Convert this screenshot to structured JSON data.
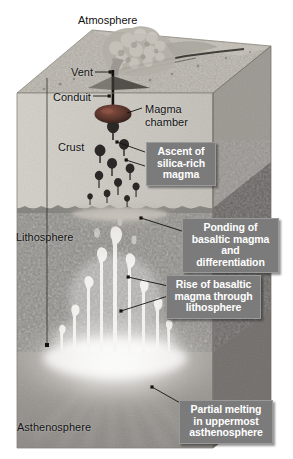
{
  "figure": {
    "kind": "geological-block-diagram",
    "width": 293,
    "height": 459,
    "background_color": "#ffffff"
  },
  "colors": {
    "callout_fill": "#7b7b7b",
    "callout_border": "#9a9a9a",
    "callout_text": "#ffffff",
    "map_label_text": "#111111",
    "crust_top_surface": "#b9b4ab",
    "crust_front_face": "#cdcac3",
    "crust_side_face": "#9d9a94",
    "lithosphere_front": "#8f8d88",
    "lithosphere_side": "#6e6c69",
    "asthenosphere_front": "#9b9894",
    "melt_glow": "#ffffff",
    "magma_chamber": "#5e3a33",
    "diapir": "#2e2b29",
    "plume": "#f2f0ec",
    "leader_line": "#14120f",
    "plume_cloud": "#b2aea6"
  },
  "map_labels": [
    {
      "name": "atmosphere",
      "text": "Atmosphere",
      "x": 78,
      "y": 14
    },
    {
      "name": "vent",
      "text": "Vent",
      "x": 71,
      "y": 66
    },
    {
      "name": "conduit",
      "text": "Conduit",
      "x": 53,
      "y": 91
    },
    {
      "name": "magma-chamber",
      "text": "Magma\nchamber",
      "x": 145,
      "y": 103
    },
    {
      "name": "crust",
      "text": "Crust",
      "x": 58,
      "y": 141
    },
    {
      "name": "lithosphere",
      "text": "Lithosphere",
      "x": 16,
      "y": 231
    },
    {
      "name": "asthenosphere",
      "text": "Asthenosphere",
      "x": 17,
      "y": 421
    }
  ],
  "callouts": [
    {
      "name": "ascent-of-silica-rich-magma",
      "text": "Ascent of\nsilica-rich\nmagma",
      "x": 146,
      "y": 142,
      "width": 70,
      "height": 44
    },
    {
      "name": "ponding-of-basaltic-magma",
      "text": "Ponding of\nbasaltic magma\nand differentiation",
      "x": 182,
      "y": 218,
      "width": 97,
      "height": 44
    },
    {
      "name": "rise-of-basaltic-magma",
      "text": "Rise of basaltic\nmagma through\nlithosphere",
      "x": 166,
      "y": 275,
      "width": 95,
      "height": 44
    },
    {
      "name": "partial-melting-asthenosphere",
      "text": "Partial melting\nin uppermost\nasthenosphere",
      "x": 179,
      "y": 400,
      "width": 94,
      "height": 44
    }
  ],
  "layers": [
    {
      "name": "crust",
      "top_y": 93,
      "bottom_y": 208
    },
    {
      "name": "lithosphere",
      "top_y": 208,
      "bottom_y": 352
    },
    {
      "name": "asthenosphere",
      "top_y": 352,
      "bottom_y": 448
    }
  ],
  "features": {
    "volcano_vent_x": 113,
    "volcano_vent_y": 72,
    "magma_chamber": {
      "cx": 113,
      "cy": 114,
      "rx": 18,
      "ry": 9
    },
    "conduit": {
      "x": 113,
      "top_y": 72,
      "bottom_y": 108
    },
    "depth_axis": {
      "x": 47,
      "top_y": 78,
      "bottom_y": 345
    },
    "ponding_sill": {
      "cx": 120,
      "cy": 216,
      "rx": 58,
      "ry": 9
    },
    "melt_zone": {
      "cx": 115,
      "cy": 368,
      "rx": 95,
      "ry": 42
    }
  }
}
